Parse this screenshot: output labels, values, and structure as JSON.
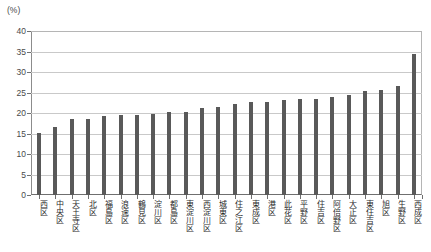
{
  "axis": {
    "unit_label": "(%)",
    "y_ticks": [
      "0",
      "5",
      "10",
      "15",
      "20",
      "25",
      "30",
      "35",
      "40"
    ]
  },
  "colors": {
    "bar": "#595959",
    "grid": "#c9c9c9",
    "axis": "#6f6f6f",
    "text": "#2b2b2b"
  },
  "chart_data": {
    "type": "bar",
    "title": "",
    "xlabel": "",
    "ylabel": "(%)",
    "ylim": [
      0,
      40
    ],
    "ytick_step": 5,
    "grid": true,
    "legend": "none",
    "categories": [
      "西区",
      "中央区",
      "天王寺区",
      "北区",
      "福島区",
      "浪速区",
      "鶴見区",
      "淀川区",
      "都島区",
      "東淀川区",
      "西淀川区",
      "城東区",
      "住之江区",
      "東成区",
      "港区",
      "此花区",
      "平野区",
      "住吉区",
      "阿倍野区",
      "大正区",
      "東住吉区",
      "旭区",
      "生野区",
      "西成区"
    ],
    "values": [
      15.2,
      16.6,
      18.6,
      18.6,
      19.3,
      19.5,
      19.6,
      19.7,
      20.3,
      20.3,
      21.2,
      21.4,
      22.2,
      22.7,
      22.8,
      23.2,
      23.4,
      23.5,
      24.0,
      24.4,
      25.3,
      25.5,
      26.6,
      34.5
    ]
  }
}
